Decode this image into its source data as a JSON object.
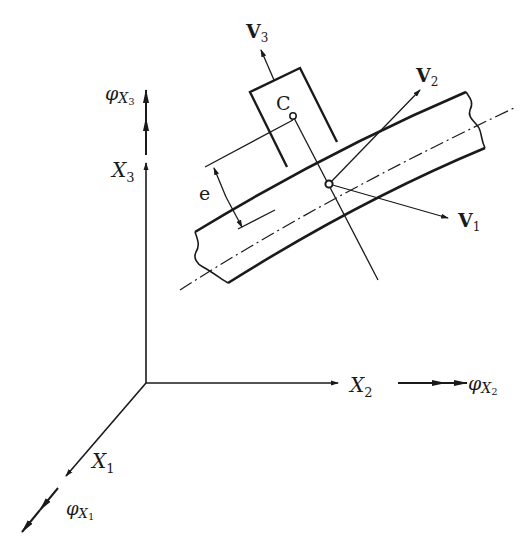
{
  "diagram": {
    "title": "",
    "axes": {
      "x1": {
        "label": "X",
        "sub": "1"
      },
      "x2": {
        "label": "X",
        "sub": "2"
      },
      "x3": {
        "label": "X",
        "sub": "3"
      }
    },
    "rotations": {
      "phi_x1": {
        "label": "φ",
        "sub_main": "X",
        "sub_index": "1"
      },
      "phi_x2": {
        "label": "φ",
        "sub_main": "X",
        "sub_index": "2"
      },
      "phi_x3": {
        "label": "φ",
        "sub_main": "X",
        "sub_index": "3"
      }
    },
    "local_vectors": {
      "v1": {
        "label": "V",
        "sub": "1"
      },
      "v2": {
        "label": "V",
        "sub": "2"
      },
      "v3": {
        "label": "V",
        "sub": "3"
      }
    },
    "points": {
      "c": {
        "label": "C"
      }
    },
    "dimensions": {
      "eccentricity": {
        "label": "e"
      }
    },
    "colors": {
      "ink": "#1a1a1a",
      "background": "#ffffff"
    }
  }
}
